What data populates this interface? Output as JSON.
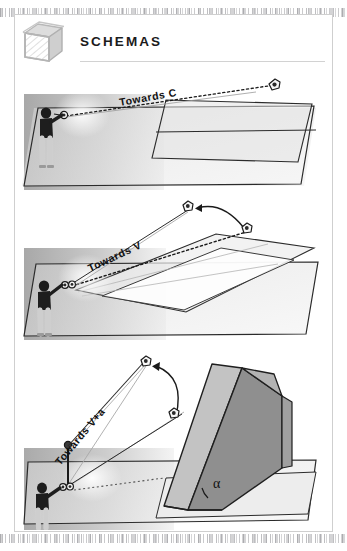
{
  "page": {
    "background_color": "#ffffff",
    "frame_color": "#cfcfcf"
  },
  "header": {
    "icon": "hatched-box-icon",
    "title": "SCHEMAS",
    "rule": true
  },
  "diagrams": [
    {
      "id": "diagram-towards-c",
      "label": "Towards C",
      "figure": "person-with-instrument",
      "target_icon": "camera-station-icon",
      "sight_line_style": "dotted",
      "surface": "horizontal-plane-with-vertical-wall",
      "annotations": []
    },
    {
      "id": "diagram-towards-v",
      "label": "Towards V",
      "figure": "person-with-instrument",
      "target_icon": "camera-station-icon",
      "second_icon": "camera-station-icon",
      "sight_line_style": "dotted",
      "arrow": "curved-arrow-right-to-left",
      "surface": "inclined-plane-over-horizontal-plane",
      "annotations": []
    },
    {
      "id": "diagram-towards-v-plus-a",
      "label": "Towards V+a",
      "figure": "person-with-instrument",
      "target_icon": "camera-station-icon",
      "second_icon": "camera-station-icon",
      "sight_line_style": "dotted",
      "arrow": "curved-arrow-up",
      "surface": "wedge-ramp-on-horizontal-plane",
      "angle_symbol": "α"
    }
  ],
  "colors": {
    "ink": "#111111",
    "plane_light": "#e9e9e9",
    "plane_mid": "#c9c9c9",
    "plane_dark": "#9a9a9a",
    "wall_gradient_from": "#b4b4b4",
    "wall_gradient_to": "#f2f2f2",
    "figure_top": "#1a1a1a",
    "figure_legs": "#e2e2e2",
    "rule": "#d2d2d2"
  }
}
